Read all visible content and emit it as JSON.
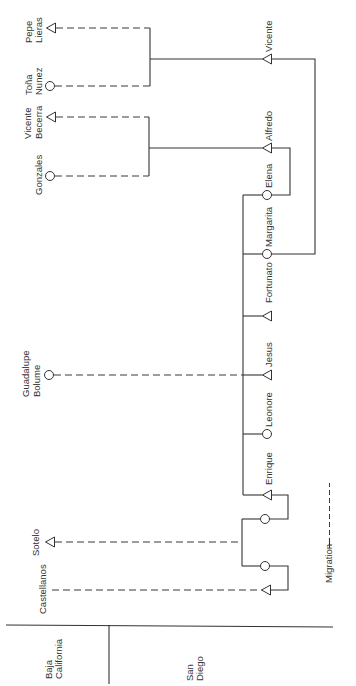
{
  "legend": {
    "migration_label": "Migration",
    "migration_line_style": "dashed"
  },
  "symbols": {
    "male": "triangle",
    "female": "circle"
  },
  "regions": {
    "baja_california": {
      "label": [
        "Baja",
        "California"
      ]
    },
    "san_diego": {
      "label": [
        "San",
        "Diego"
      ]
    }
  },
  "people": {
    "pepe_lieras": {
      "label": [
        "Pepe",
        "Lieras"
      ],
      "sex": "male",
      "region": "Baja California"
    },
    "tona_nunez": {
      "label": [
        "Toña",
        "Nunez"
      ],
      "sex": "female",
      "region": "Baja California"
    },
    "vicente_becerra": {
      "label": [
        "Vicente",
        "Becerra"
      ],
      "sex": "male",
      "region": "Baja California"
    },
    "gonzales": {
      "label": [
        "Gonzales"
      ],
      "sex": "female",
      "region": "Baja California"
    },
    "guadalupe_bolume": {
      "label": [
        "Guadalupe",
        "Bolume"
      ],
      "sex": "female",
      "region": "Baja California"
    },
    "sotelo": {
      "label": [
        "Sotelo"
      ],
      "sex": "male",
      "region": "Baja California"
    },
    "castellanos": {
      "label": [
        "Castellanos"
      ],
      "sex": null,
      "region": "Baja California"
    },
    "vicente": {
      "label": "Vicente",
      "sex": "male",
      "region": "San Diego"
    },
    "alfredo": {
      "label": "Alfredo",
      "sex": "male",
      "region": "San Diego"
    },
    "elena": {
      "label": "Elena",
      "sex": "female",
      "region": "San Diego"
    },
    "margarita": {
      "label": "Margarita",
      "sex": "female",
      "region": "San Diego"
    },
    "fortunato": {
      "label": "Fortunato",
      "sex": "male",
      "region": "San Diego"
    },
    "jesus": {
      "label": "Jesus",
      "sex": "male",
      "region": "San Diego"
    },
    "leonore": {
      "label": "Leonore",
      "sex": "female",
      "region": "San Diego"
    },
    "enrique": {
      "label": "Enrique",
      "sex": "male",
      "region": "San Diego"
    },
    "unnamed_female_1": {
      "label": "",
      "sex": "female",
      "region": "San Diego"
    },
    "unnamed_female_2": {
      "label": "",
      "sex": "female",
      "region": "San Diego"
    },
    "unnamed_male_1": {
      "label": "",
      "sex": "male",
      "region": "San Diego"
    }
  },
  "relationships": {
    "couples": [
      [
        "pepe_lieras",
        "tona_nunez"
      ],
      [
        "vicente_becerra",
        "gonzales"
      ],
      [
        "vicente",
        "margarita"
      ],
      [
        "alfredo",
        "elena"
      ],
      [
        "enrique",
        "unnamed_female_1"
      ],
      [
        "unnamed_female_2",
        "unnamed_male_1"
      ]
    ],
    "descent": [
      {
        "parents": [
          "pepe_lieras",
          "tona_nunez"
        ],
        "children": [
          "vicente"
        ]
      },
      {
        "parents": [
          "vicente_becerra",
          "gonzales"
        ],
        "children": [
          "alfredo"
        ]
      }
    ],
    "sibling_groups": [
      [
        "elena",
        "margarita",
        "fortunato",
        "jesus",
        "leonore",
        "enrique"
      ],
      [
        "unnamed_female_1",
        "unnamed_female_2"
      ]
    ],
    "migration_links": [
      {
        "from": "pepe_lieras",
        "to": "vicente"
      },
      {
        "from": "tona_nunez",
        "to": "vicente"
      },
      {
        "from": "vicente_becerra",
        "to": "alfredo"
      },
      {
        "from": "gonzales",
        "to": "alfredo"
      },
      {
        "from": "guadalupe_bolume",
        "to": "sibling_group_1"
      },
      {
        "from": "sotelo",
        "to": "sibling_group_2"
      },
      {
        "from": "castellanos",
        "to": "unnamed_male_1"
      }
    ]
  }
}
